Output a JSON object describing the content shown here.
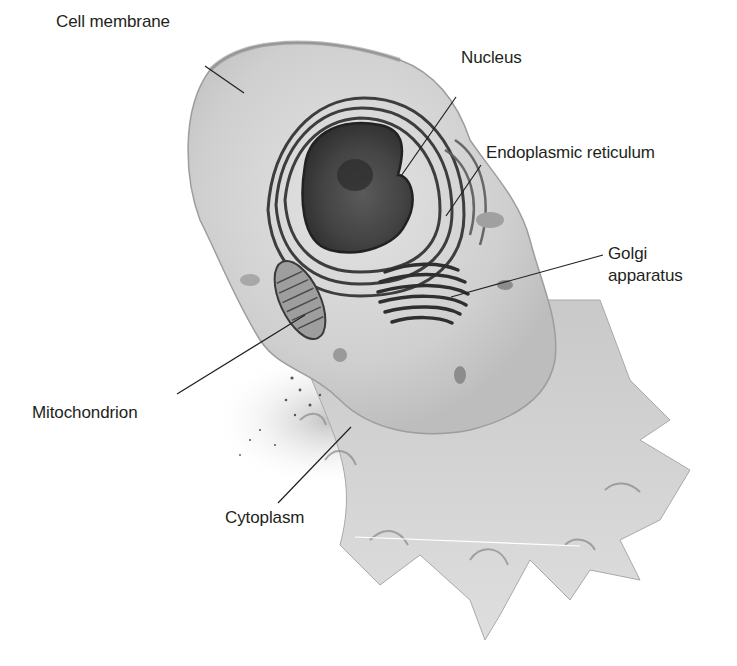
{
  "diagram": {
    "background_color": "#ffffff",
    "label_color": "#231f20",
    "labels": [
      {
        "id": "cell-membrane",
        "text": "Cell membrane",
        "x": 56,
        "y": 12
      },
      {
        "id": "nucleus",
        "text": "Nucleus",
        "x": 461,
        "y": 48
      },
      {
        "id": "endoplasmic-reticulum",
        "text": "Endoplasmic reticulum",
        "x": 486,
        "y": 143
      },
      {
        "id": "golgi-line1",
        "text": "Golgi",
        "x": 608,
        "y": 244
      },
      {
        "id": "golgi-line2",
        "text": "apparatus",
        "x": 608,
        "y": 266
      },
      {
        "id": "mitochondrion",
        "text": "Mitochondrion",
        "x": 32,
        "y": 403
      },
      {
        "id": "cytoplasm",
        "text": "Cytoplasm",
        "x": 225,
        "y": 508
      }
    ],
    "leader_lines": [
      {
        "for": "cell-membrane",
        "x1": 205,
        "y1": 66,
        "x2": 244,
        "y2": 93
      },
      {
        "for": "nucleus",
        "x1": 456,
        "y1": 97,
        "x2": 401,
        "y2": 176
      },
      {
        "for": "endoplasmic-reticulum",
        "x1": 481,
        "y1": 165,
        "x2": 446,
        "y2": 216
      },
      {
        "for": "golgi-apparatus",
        "x1": 603,
        "y1": 255,
        "x2": 451,
        "y2": 297
      },
      {
        "for": "mitochondrion",
        "x1": 177,
        "y1": 394,
        "x2": 305,
        "y2": 315
      },
      {
        "for": "cytoplasm",
        "x1": 278,
        "y1": 503,
        "x2": 351,
        "y2": 427
      }
    ]
  }
}
